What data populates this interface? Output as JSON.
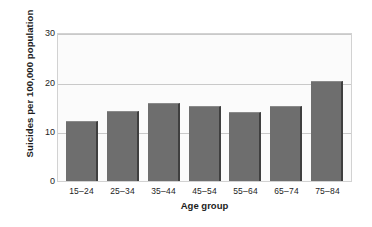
{
  "chart_data": {
    "type": "bar",
    "title": "",
    "subtitle": "",
    "xlabel": "Age group",
    "ylabel": "Suicides per 100,000 population",
    "categories": [
      "15–24",
      "25–34",
      "35–44",
      "45–54",
      "55–64",
      "65–74",
      "75–84"
    ],
    "values": [
      12.2,
      14.3,
      15.9,
      15.3,
      14.0,
      15.3,
      20.4
    ],
    "ylim": [
      0,
      30
    ],
    "yticks": [
      0,
      10,
      20,
      30
    ],
    "ytick_labels": [
      "0",
      "10",
      "20",
      "30"
    ],
    "grid": true,
    "grid_axis": "y",
    "legend": "none",
    "bar_color": "#6e6e6e",
    "bar_edge_color": "#3f3f3f",
    "plot_background": "#fbfbfb",
    "grid_color": "#c9c9c9",
    "axis_border_color": "#d2d2d2",
    "figure_background": "#ffffff",
    "text_color": "#1d1d1d"
  }
}
